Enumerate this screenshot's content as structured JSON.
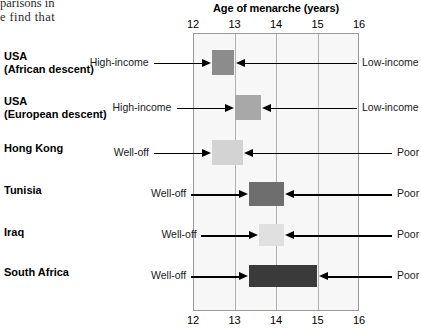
{
  "book_text": {
    "line1": "parisons in",
    "line2": "e find that"
  },
  "chart_data": {
    "type": "bar",
    "orientation": "horizontal-range",
    "title": "Age of menarche (years)",
    "xlabel": "Age of menarche (years)",
    "ylabel": "",
    "xlim": [
      12,
      16
    ],
    "xticks": [
      12,
      13,
      14,
      15,
      16
    ],
    "xtick_labels": [
      "12",
      "13",
      "14",
      "15",
      "16"
    ],
    "grid": true,
    "axis_top": true,
    "axis_bottom": true,
    "legend": "none",
    "left_annotation_header": "",
    "right_annotation_header": "",
    "categories": [
      "USA\n(African descent)",
      "USA\n(European descent)",
      "Hong Kong",
      "Tunisia",
      "Iraq",
      "South Africa"
    ],
    "bars": [
      {
        "category": "USA (African descent)",
        "category_line1": "USA",
        "category_line2": "(African descent)",
        "left_label": "High-income",
        "right_label": "Low-income",
        "start": 12.45,
        "end": 13.0,
        "color": "#8c8c8c"
      },
      {
        "category": "USA (European descent)",
        "category_line1": "USA",
        "category_line2": "(European descent)",
        "left_label": "High-income",
        "right_label": "Low-income",
        "start": 13.0,
        "end": 13.65,
        "color": "#a8a8a8"
      },
      {
        "category": "Hong Kong",
        "category_line1": "Hong Kong",
        "category_line2": "",
        "left_label": "Well-off",
        "right_label": "Poor",
        "start": 12.45,
        "end": 13.2,
        "color": "#d3d3d3"
      },
      {
        "category": "Tunisia",
        "category_line1": "Tunisia",
        "category_line2": "",
        "left_label": "Well-off",
        "right_label": "Poor",
        "start": 13.35,
        "end": 14.2,
        "color": "#6e6e6e"
      },
      {
        "category": "Iraq",
        "category_line1": "Iraq",
        "category_line2": "",
        "left_label": "Well-off",
        "right_label": "Poor",
        "start": 13.6,
        "end": 14.2,
        "color": "#e0e0e0"
      },
      {
        "category": "South Africa",
        "category_line1": "South Africa",
        "category_line2": "",
        "left_label": "Well-off",
        "right_label": "Poor",
        "start": 13.35,
        "end": 15.0,
        "color": "#3a3a3a"
      }
    ],
    "colors": {
      "plot_background": "#f7f7f7",
      "plot_border": "#9a9a9a",
      "gridline": "#b0b0b0",
      "arrow": "#000000",
      "text": "#000000"
    }
  }
}
